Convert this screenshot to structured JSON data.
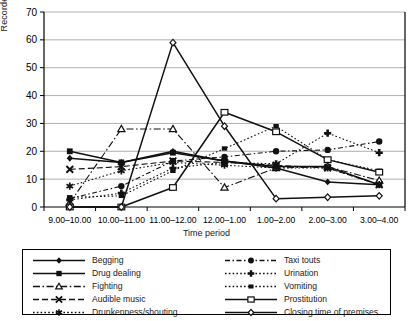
{
  "chart_data": {
    "type": "line",
    "title": "",
    "xlabel": "Time period",
    "ylabel": "Recorded incidents",
    "ylim": [
      0,
      70
    ],
    "ytick_step": 10,
    "yticks": [
      0,
      10,
      20,
      30,
      40,
      50,
      60,
      70
    ],
    "grid": true,
    "legend_position": "bottom",
    "categories": [
      "9.00–10.00",
      "10.00–11.00",
      "11.00–12.00",
      "12.00–1.00",
      "1.00–2.00",
      "2.00–3.00",
      "3.00–4.00"
    ],
    "series": [
      {
        "name": "Begging",
        "marker": "diamond-filled",
        "line": "solid",
        "values": [
          17.5,
          16,
          20,
          16.5,
          14,
          9,
          8
        ]
      },
      {
        "name": "Drug dealing",
        "marker": "square-filled",
        "line": "solid",
        "values": [
          20,
          16,
          19.5,
          16.5,
          14.5,
          14.5,
          8
        ]
      },
      {
        "name": "Fighting",
        "marker": "triangle-open",
        "line": "dashdot",
        "values": [
          1.5,
          28,
          28,
          7,
          14,
          14.5,
          9.5
        ]
      },
      {
        "name": "Audible music",
        "marker": "x-cross",
        "line": "dashed",
        "values": [
          13.5,
          14.5,
          16.5,
          16,
          15,
          14,
          8
        ]
      },
      {
        "name": "Drunkenness/shouting",
        "marker": "asterisk",
        "line": "dotted",
        "values": [
          7.5,
          13,
          16,
          15,
          14,
          14,
          8
        ]
      },
      {
        "name": "Taxi touts",
        "marker": "circle-filled",
        "line": "dashed-dot",
        "values": [
          3,
          7.5,
          16.5,
          18,
          20,
          20.5,
          23.5
        ]
      },
      {
        "name": "Urination",
        "marker": "plus-filled",
        "line": "dotted",
        "values": [
          2.5,
          5,
          14,
          16,
          15.5,
          26.5,
          19.5
        ]
      },
      {
        "name": "Vomiting",
        "marker": "square-small",
        "line": "dotted",
        "values": [
          3.5,
          4,
          13,
          21,
          29,
          17,
          13
        ]
      },
      {
        "name": "Prostitution",
        "marker": "square-open",
        "line": "solid",
        "values": [
          0,
          0,
          7,
          34,
          27,
          17,
          12.5
        ]
      },
      {
        "name": "Closing time of premises",
        "marker": "diamond-open",
        "line": "solid",
        "values": [
          0,
          0,
          59,
          29,
          3,
          3.5,
          4
        ]
      }
    ]
  },
  "legend": {
    "left": [
      "Begging",
      "Drug dealing",
      "Fighting",
      "Audible music",
      "Drunkenness/shouting"
    ],
    "right": [
      "Taxi touts",
      "Urination",
      "Vomiting",
      "Prostitution",
      "Closing time of premises"
    ]
  },
  "axes": {
    "ylabel": "Recorded incidents",
    "xlabel": "Time period"
  },
  "colors": {
    "line": "#111111",
    "grid": "#9a9a9a",
    "axis": "#000000",
    "background": "#ffffff"
  }
}
